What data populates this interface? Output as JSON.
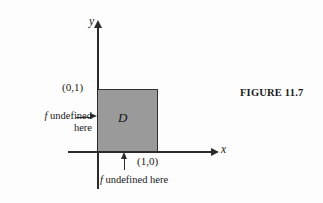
{
  "figure": {
    "caption": "FIGURE 11.7",
    "region_label": "D",
    "axes": {
      "x_label": "x",
      "y_label": "y"
    },
    "points": [
      {
        "name": "top-left-corner",
        "label": "(0,1)"
      },
      {
        "name": "bottom-right-corner",
        "label": "(1,0)"
      }
    ],
    "annotations": {
      "left": {
        "italic_symbol": "f",
        "line1": " undefined",
        "line2": "here"
      },
      "bottom": {
        "italic_symbol": "f",
        "text": " undefined here"
      }
    },
    "colors": {
      "region_fill": "#9a9a9a",
      "stroke": "#2b2b2b",
      "background": "#fdfdfd"
    }
  }
}
